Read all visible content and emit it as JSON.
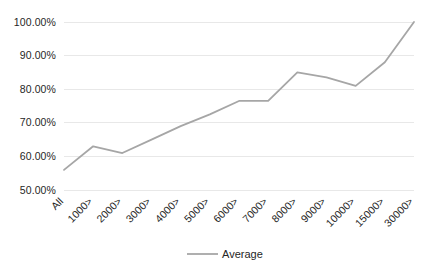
{
  "chart_data": {
    "type": "line",
    "title": "",
    "xlabel": "",
    "ylabel": "",
    "categories": [
      "All",
      "1000>",
      "2000>",
      "3000>",
      "4000>",
      "5000>",
      "6000>",
      "7000>",
      "8000>",
      "9000>",
      "10000>",
      "15000>",
      "30000>"
    ],
    "series": [
      {
        "name": "Average",
        "color": "#a6a6a6",
        "values": [
          56.0,
          63.0,
          61.0,
          65.0,
          69.0,
          72.5,
          76.5,
          76.5,
          85.0,
          83.5,
          81.0,
          88.0,
          100.0
        ]
      }
    ],
    "ylim": [
      50,
      100
    ],
    "ytick_values": [
      50,
      60,
      70,
      80,
      90,
      100
    ],
    "ytick_labels": [
      "50.00%",
      "60.00%",
      "70.00%",
      "80.00%",
      "90.00%",
      "100.00%"
    ],
    "grid": true,
    "grid_axis": "y",
    "legend_position": "bottom",
    "legend_entries": [
      "Average"
    ]
  },
  "legend": {
    "average_label": "Average"
  },
  "colors": {
    "series": "#a6a6a6",
    "gridline": "#e8e8e8",
    "text": "#262626",
    "background": "#ffffff"
  }
}
